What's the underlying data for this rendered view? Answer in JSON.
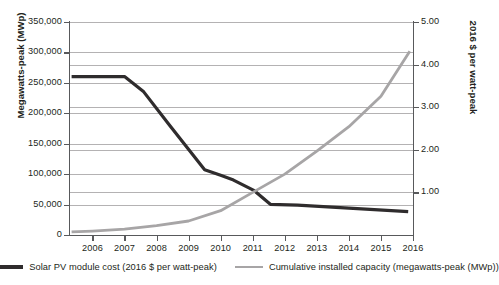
{
  "chart_data": {
    "type": "line",
    "title": "",
    "xlabel": "",
    "ylabel": "Megawatts-peak (MWp)",
    "y2label": "2016 $ per watt-peak",
    "xlim": [
      2005.3,
      2016.0
    ],
    "ylim": [
      0,
      350000
    ],
    "y2lim": [
      0,
      5.0
    ],
    "grid": true,
    "legend_position": "bottom",
    "x_tick_labels": [
      "2006",
      "2007",
      "2008",
      "2009",
      "2010",
      "2011",
      "2012",
      "2013",
      "2014",
      "2015",
      "2016"
    ],
    "x_ticks": [
      2006,
      2007,
      2008,
      2009,
      2010,
      2011,
      2012,
      2013,
      2014,
      2015,
      2016
    ],
    "y_tick_labels": [
      "0",
      "50,000",
      "100,000",
      "150,000",
      "200,000",
      "250,000",
      "300,000",
      "350,000"
    ],
    "y_ticks": [
      0,
      50000,
      100000,
      150000,
      200000,
      250000,
      300000,
      350000
    ],
    "y2_tick_labels": [
      "1.00",
      "2.00",
      "3.00",
      "4.00",
      "5.00"
    ],
    "y2_ticks": [
      1.0,
      2.0,
      3.0,
      4.0,
      5.0
    ],
    "series": [
      {
        "name": "Solar PV module cost (2016 $ per watt-peak)",
        "axis": "right",
        "color": "#2f2c2d",
        "width": 3.2,
        "x": [
          2005.35,
          2007.0,
          2007.6,
          2008.4,
          2009.5,
          2010.0,
          2010.4,
          2011.05,
          2011.55,
          2012.4,
          2014.0,
          2015.85
        ],
        "values": [
          3.72,
          3.72,
          3.36,
          2.58,
          1.53,
          1.4,
          1.29,
          1.04,
          0.72,
          0.7,
          0.63,
          0.55
        ]
      },
      {
        "name": "Cumulative installed capacity (megawatts-peak (MWp))",
        "axis": "left",
        "color": "#a7a5a6",
        "width": 2.8,
        "x": [
          2005.35,
          2006.0,
          2007.0,
          2008.0,
          2009.0,
          2010.0,
          2011.0,
          2012.0,
          2013.0,
          2014.0,
          2015.0,
          2015.9
        ],
        "values": [
          5000,
          6500,
          9500,
          15500,
          23000,
          40000,
          70000,
          100000,
          138000,
          178000,
          228000,
          302000
        ]
      }
    ]
  },
  "legend": {
    "items": [
      {
        "label": "Solar PV module cost (2016 $ per watt-peak)",
        "color": "#2f2c2d"
      },
      {
        "label": "Cumulative installed capacity (megawatts-peak (MWp))",
        "color": "#a7a5a6"
      }
    ]
  }
}
